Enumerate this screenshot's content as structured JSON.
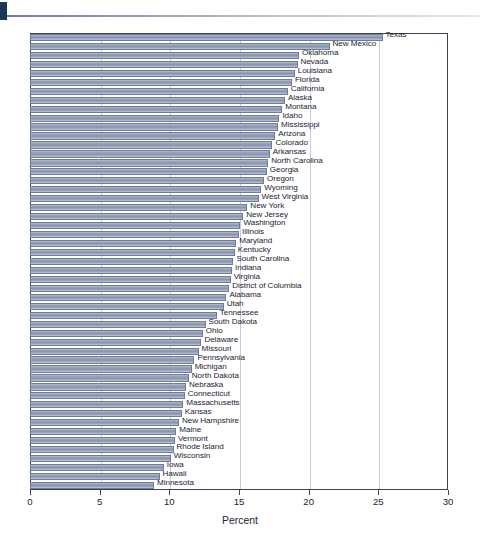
{
  "header": {
    "tab_marker": "navy-tab",
    "rule": "horizontal-rule"
  },
  "chart_data": {
    "type": "bar",
    "orientation": "horizontal",
    "title": "",
    "subtitle": "",
    "xlabel": "Percent",
    "ylabel": "",
    "xlim": [
      0,
      30
    ],
    "xticks": [
      0,
      5,
      10,
      15,
      20,
      25,
      30
    ],
    "xtick_labels": [
      "0",
      "5",
      "10",
      "15",
      "20",
      "25",
      "30"
    ],
    "grid": "vertical",
    "legend": "none",
    "bar_color": "#8f9cb5",
    "bar_edge_color": "#6f7c96",
    "categories": [
      "Texas",
      "New Mexico",
      "Oklahoma",
      "Nevada",
      "Louisiana",
      "Florida",
      "California",
      "Alaska",
      "Montana",
      "Idaho",
      "Mississippi",
      "Arizona",
      "Colorado",
      "Arkansas",
      "North Carolina",
      "Georgia",
      "Oregon",
      "Wyoming",
      "West Virginia",
      "New York",
      "New Jersey",
      "Washington",
      "Illinois",
      "Maryland",
      "Kentucky",
      "South Carolina",
      "Indiana",
      "Virginia",
      "District of Columbia",
      "Alabama",
      "Utah",
      "Tennessee",
      "South Dakota",
      "Ohio",
      "Delaware",
      "Missouri",
      "Pennsylvania",
      "Michigan",
      "North Dakota",
      "Nebraska",
      "Connecticut",
      "Massachusetts",
      "Kansas",
      "New Hampshire",
      "Maine",
      "Vermont",
      "Rhode Island",
      "Wisconsin",
      "Iowa",
      "Hawaii",
      "Minnesota"
    ],
    "values": [
      25.3,
      21.5,
      19.3,
      19.2,
      19.0,
      18.8,
      18.5,
      18.3,
      18.1,
      17.9,
      17.8,
      17.6,
      17.4,
      17.2,
      17.1,
      17.0,
      16.8,
      16.6,
      16.4,
      15.6,
      15.3,
      15.1,
      15.0,
      14.8,
      14.7,
      14.6,
      14.5,
      14.4,
      14.3,
      14.1,
      13.9,
      13.4,
      12.6,
      12.4,
      12.3,
      12.1,
      11.8,
      11.6,
      11.4,
      11.2,
      11.1,
      11.0,
      10.9,
      10.7,
      10.5,
      10.4,
      10.3,
      10.1,
      9.6,
      9.3,
      8.9
    ]
  }
}
